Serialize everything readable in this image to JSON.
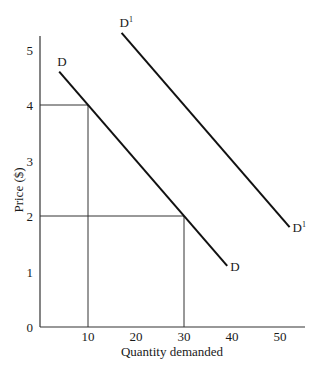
{
  "chart_data": {
    "type": "line",
    "title": "",
    "xlabel": "Quantity demanded",
    "ylabel": "Price ($)",
    "xlim": [
      0,
      55
    ],
    "ylim": [
      0,
      5.4
    ],
    "x_ticks": [
      "10",
      "20",
      "30",
      "40",
      "50"
    ],
    "y_ticks": [
      "0",
      "1",
      "2",
      "3",
      "4",
      "5"
    ],
    "grid": false,
    "legend": "none",
    "series": [
      {
        "name": "D",
        "label_start": "D",
        "label_end": "D",
        "points": [
          [
            4,
            4.6
          ],
          [
            39,
            1.1
          ]
        ]
      },
      {
        "name": "D1",
        "label_start": "D",
        "label_start_sup": "1",
        "label_end": "D",
        "label_end_sup": "1",
        "points": [
          [
            17,
            5.3
          ],
          [
            52,
            1.8
          ]
        ]
      }
    ],
    "reference_lines": [
      {
        "name": "price-4-guide",
        "from": [
          0,
          4
        ],
        "to": [
          10,
          4
        ]
      },
      {
        "name": "qty-10-guide",
        "from": [
          10,
          0
        ],
        "to": [
          10,
          4
        ]
      },
      {
        "name": "price-2-guide",
        "from": [
          0,
          2
        ],
        "to": [
          30,
          2
        ]
      },
      {
        "name": "qty-30-guide",
        "from": [
          30,
          0
        ],
        "to": [
          30,
          2
        ]
      }
    ],
    "annotations": [
      {
        "text": "At price $4, quantity demanded is 10 on curve D"
      },
      {
        "text": "At price $2, quantity demanded is 30 on curve D"
      }
    ]
  },
  "colors": {
    "line": "#111111",
    "axis": "#333333",
    "guide": "#333333",
    "text": "#1a1a1a",
    "background": "#ffffff"
  }
}
